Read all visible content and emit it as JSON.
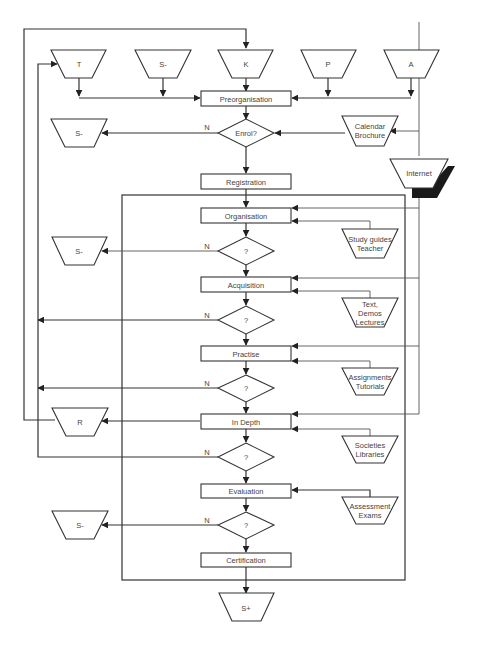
{
  "diagram": {
    "title": "",
    "sources": [
      {
        "id": "T",
        "label": "T"
      },
      {
        "id": "S-top",
        "label": "S-"
      },
      {
        "id": "K",
        "label": "K"
      },
      {
        "id": "P",
        "label": "P"
      },
      {
        "id": "A",
        "label": "A"
      }
    ],
    "process_steps": [
      {
        "id": "preorganisation",
        "label": "Preorganisation"
      },
      {
        "id": "registration",
        "label": "Registration"
      },
      {
        "id": "organisation",
        "label": "Organisation"
      },
      {
        "id": "acquisition",
        "label": "Acquisition"
      },
      {
        "id": "practise",
        "label": "Practise"
      },
      {
        "id": "in-depth",
        "label": "In Depth"
      },
      {
        "id": "evaluation",
        "label": "Evaluation"
      },
      {
        "id": "certification",
        "label": "Certification"
      }
    ],
    "decisions": [
      {
        "id": "enrol",
        "label": "Enrol?",
        "no_label": "N"
      },
      {
        "id": "decision-organisation",
        "label": "?",
        "no_label": "N"
      },
      {
        "id": "decision-acquisition",
        "label": "?",
        "no_label": "N"
      },
      {
        "id": "decision-practise",
        "label": "?",
        "no_label": "N"
      },
      {
        "id": "decision-in-depth",
        "label": "?",
        "no_label": "N"
      },
      {
        "id": "decision-evaluation",
        "label": "?",
        "no_label": "N"
      }
    ],
    "resources": [
      {
        "id": "calendar-brochure",
        "lines": [
          "Calendar",
          "Brochure"
        ]
      },
      {
        "id": "internet",
        "lines": [
          "Internet"
        ]
      },
      {
        "id": "study-guides",
        "lines": [
          "Study guides",
          "Teacher"
        ]
      },
      {
        "id": "text-demos",
        "lines": [
          "Text,",
          "Demos",
          "Lectures"
        ]
      },
      {
        "id": "assignments",
        "lines": [
          "Assignments",
          "Tutorials"
        ]
      },
      {
        "id": "societies",
        "lines": [
          "Societies",
          "Libraries"
        ]
      },
      {
        "id": "assessment",
        "lines": [
          "Assessment",
          "Exams"
        ]
      }
    ],
    "sinks": [
      {
        "id": "S-enrol",
        "label": "S-"
      },
      {
        "id": "S-organisation",
        "label": "S-"
      },
      {
        "id": "R",
        "label": "R"
      },
      {
        "id": "S-evaluation",
        "label": "S-"
      },
      {
        "id": "S-plus",
        "label": "S+"
      }
    ]
  }
}
